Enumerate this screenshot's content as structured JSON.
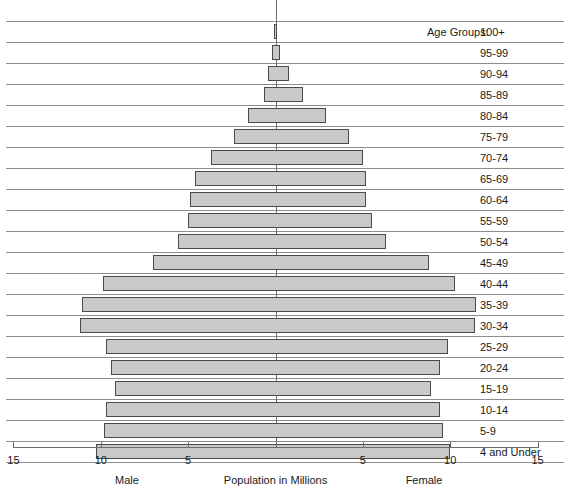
{
  "chart_data": {
    "type": "bar",
    "subtype": "population-pyramid",
    "title": "",
    "xlabel": "Population in Millions",
    "ylabel": "Age Groups:",
    "left_series_label": "Male",
    "right_series_label": "Female",
    "axis_label_left": "Male",
    "axis_label_center": "Population in Millions",
    "axis_label_right": "Female",
    "age_groups_caption": "Age Groups:",
    "xlim": [
      -15,
      15
    ],
    "xtick_values": [
      -15,
      -10,
      -5,
      0,
      5,
      10,
      15
    ],
    "xtick_labels": [
      "15",
      "10",
      "5",
      "",
      "5",
      "10",
      "15"
    ],
    "grid": true,
    "legend": "none",
    "units": "millions",
    "categories": [
      "100+",
      "95-99",
      "90-94",
      "85-89",
      "80-84",
      "75-79",
      "70-74",
      "65-69",
      "60-64",
      "55-59",
      "50-54",
      "45-49",
      "40-44",
      "35-39",
      "30-34",
      "25-29",
      "20-24",
      "15-19",
      "10-14",
      "5-9",
      "4 and Under"
    ],
    "series": [
      {
        "name": "Male",
        "side": "left",
        "values": [
          0.1,
          0.2,
          0.45,
          0.65,
          1.6,
          2.4,
          3.7,
          4.6,
          4.9,
          5.0,
          5.6,
          7.0,
          9.9,
          11.1,
          11.2,
          9.7,
          9.4,
          9.2,
          9.7,
          9.8,
          10.3
        ]
      },
      {
        "name": "Female",
        "side": "right",
        "values": [
          0.1,
          0.25,
          0.75,
          1.6,
          2.9,
          4.2,
          5.0,
          5.2,
          5.2,
          5.5,
          6.3,
          8.8,
          10.3,
          11.5,
          11.4,
          9.9,
          9.4,
          8.9,
          9.4,
          9.6,
          10.0
        ]
      }
    ]
  }
}
